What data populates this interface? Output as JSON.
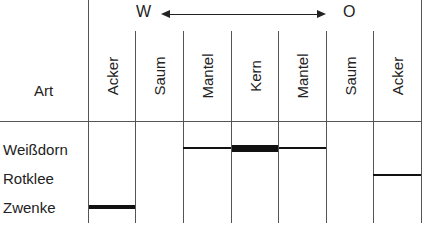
{
  "header": {
    "row_header": "Art",
    "direction_left": "W",
    "direction_right": "O"
  },
  "columns": [
    {
      "label": "Acker"
    },
    {
      "label": "Saum"
    },
    {
      "label": "Mantel"
    },
    {
      "label": "Kern"
    },
    {
      "label": "Mantel"
    },
    {
      "label": "Saum"
    },
    {
      "label": "Acker"
    }
  ],
  "rows": [
    {
      "label": "Weißdorn"
    },
    {
      "label": "Rotklee"
    },
    {
      "label": "Zwenke"
    }
  ],
  "occurrence": [
    {
      "species": "Weißdorn",
      "zones": [
        "Mantel",
        "Kern",
        "Mantel"
      ],
      "strength": [
        "normal",
        "strong",
        "normal"
      ]
    },
    {
      "species": "Rotklee",
      "zones": [
        "Acker (O)"
      ],
      "strength": [
        "normal"
      ]
    },
    {
      "species": "Zwenke",
      "zones": [
        "Acker (W)"
      ],
      "strength": [
        "strong"
      ]
    }
  ]
}
